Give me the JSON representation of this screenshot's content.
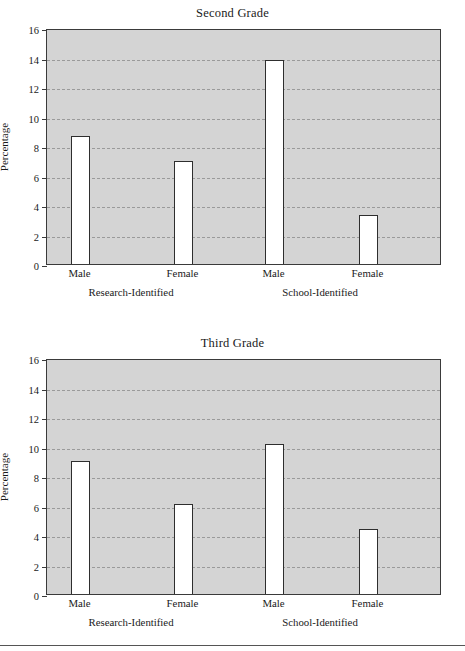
{
  "figure": {
    "charts": [
      {
        "id": "second-grade",
        "title": "Second Grade",
        "ylabel": "Percentage",
        "yticks": [
          "0",
          "2",
          "4",
          "6",
          "8",
          "10",
          "12",
          "14",
          "16"
        ],
        "xticks": [
          "Male",
          "Female",
          "Male",
          "Female"
        ],
        "groups": [
          "Research-Identified",
          "School-Identified"
        ]
      },
      {
        "id": "third-grade",
        "title": "Third Grade",
        "ylabel": "Percentage",
        "yticks": [
          "0",
          "2",
          "4",
          "6",
          "8",
          "10",
          "12",
          "14",
          "16"
        ],
        "xticks": [
          "Male",
          "Female",
          "Male",
          "Female"
        ],
        "groups": [
          "Research-Identified",
          "School-Identified"
        ]
      }
    ]
  },
  "chart_data": [
    {
      "type": "bar",
      "title": "Second Grade",
      "xlabel": "",
      "ylabel": "Percentage",
      "ylim": [
        0,
        16
      ],
      "ytick_values": [
        0,
        2,
        4,
        6,
        8,
        10,
        12,
        14,
        16
      ],
      "grid": "horizontal-dashed",
      "legend": "none",
      "categories": [
        "Male",
        "Female",
        "Male",
        "Female"
      ],
      "groups": [
        {
          "name": "Research-Identified",
          "categories": [
            "Male",
            "Female"
          ],
          "values": [
            8.7,
            7.0
          ]
        },
        {
          "name": "School-Identified",
          "categories": [
            "Male",
            "Female"
          ],
          "values": [
            13.8,
            3.35
          ]
        }
      ],
      "values": [
        8.7,
        7.0,
        13.8,
        3.35
      ],
      "bar_facecolor": "#ffffff",
      "bar_edgecolor": "#2e2e2e",
      "panel_facecolor": "#d4d4d4"
    },
    {
      "type": "bar",
      "title": "Third Grade",
      "xlabel": "",
      "ylabel": "Percentage",
      "ylim": [
        0,
        16
      ],
      "ytick_values": [
        0,
        2,
        4,
        6,
        8,
        10,
        12,
        14,
        16
      ],
      "grid": "horizontal-dashed",
      "legend": "none",
      "categories": [
        "Male",
        "Female",
        "Male",
        "Female"
      ],
      "groups": [
        {
          "name": "Research-Identified",
          "categories": [
            "Male",
            "Female"
          ],
          "values": [
            9.05,
            6.1
          ]
        },
        {
          "name": "School-Identified",
          "categories": [
            "Male",
            "Female"
          ],
          "values": [
            10.15,
            4.4
          ]
        }
      ],
      "values": [
        9.05,
        6.1,
        10.15,
        4.4
      ],
      "bar_facecolor": "#ffffff",
      "bar_edgecolor": "#2e2e2e",
      "panel_facecolor": "#d4d4d4"
    }
  ]
}
